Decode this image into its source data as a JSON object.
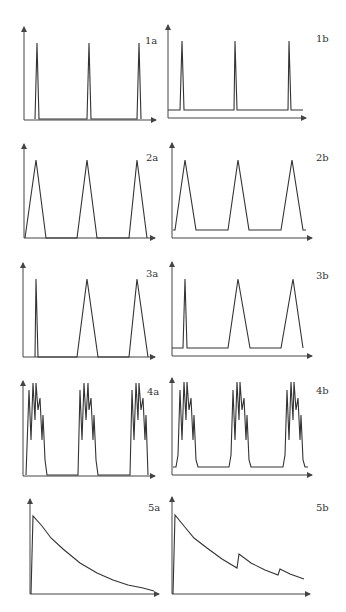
{
  "colors": {
    "line": "#333333",
    "axis": "#444444",
    "background": "#ffffff"
  },
  "panels": [
    {
      "id": "1a",
      "label": "1a",
      "description": "Three narrow spikes from zero baseline"
    },
    {
      "id": "1b",
      "label": "1b",
      "description": "Three narrow spikes on elevated baseline"
    },
    {
      "id": "2a",
      "label": "2a",
      "description": "Three triangular pulses from zero baseline"
    },
    {
      "id": "2b",
      "label": "2b",
      "description": "Three triangular pulses on elevated baseline"
    },
    {
      "id": "3a",
      "label": "3a",
      "description": "One narrow spike followed by two triangular pulses, zero baseline"
    },
    {
      "id": "3b",
      "label": "3b",
      "description": "One narrow spike followed by two triangular pulses, elevated baseline"
    },
    {
      "id": "4a",
      "label": "4a",
      "description": "Three jagged multi-peak pulse bursts, zero baseline"
    },
    {
      "id": "4b",
      "label": "4b",
      "description": "Three jagged multi-peak pulse bursts, elevated baseline"
    },
    {
      "id": "5a",
      "label": "5a",
      "description": "Single sharp rise followed by smooth exponential decay"
    },
    {
      "id": "5b",
      "label": "5b",
      "description": "Sharp rise with exponential decay, interrupted by two secondary bumps"
    }
  ]
}
